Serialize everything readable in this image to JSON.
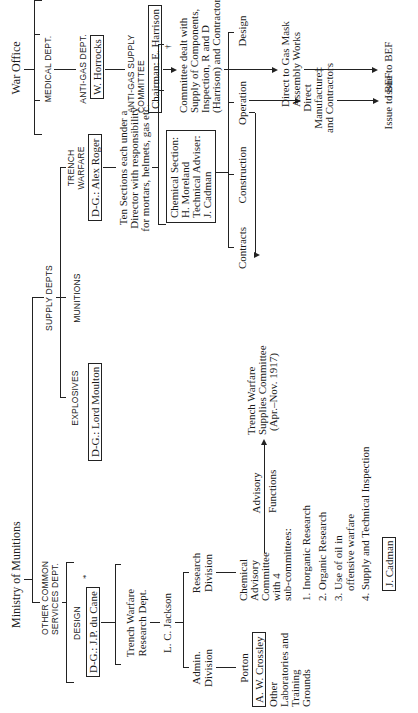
{
  "war_office": {
    "title": "War Office",
    "medical_dept": "MEDICAL DEPT.",
    "anti_gas_dept": "ANTI-GAS DEPT.",
    "anti_gas_head": "W. Horrocks",
    "anti_gas_supply_committee_l1": "ANTI-GAS SUPPLY",
    "anti_gas_supply_committee_l2": "COMMITTEE",
    "chairman": "Chairman: E. Harrison",
    "committee_desc": [
      "Committee dealt with",
      "Supply of Components,",
      "Inspection, R and D",
      "(Harrison) and Contractors"
    ],
    "gas_mask_works": [
      "Direct to Gas Mask",
      "Assembly Works"
    ],
    "issue_bef": "Issue to BEF"
  },
  "ministry": {
    "title": "Ministry of Munitions",
    "other_services_l1": "OTHER COMMON",
    "other_services_l2": "SERVICES DEPT.",
    "supply_depts": "SUPPLY DEPTS",
    "explosives": "EXPLOSIVES",
    "explosives_head": "D-G.: Lord Moulton",
    "munitions": "MUNITIONS",
    "trench_warfare_l1": "TRENCH",
    "trench_warfare_l2": "WARFARE",
    "trench_warfare_head": "D-G.: Alex Roger",
    "ten_sections": [
      "Ten Sections each under a",
      "Director with responsibility",
      "for mortars, helmets, gas etc."
    ],
    "dagger": "†",
    "chemical_section": [
      "Chemical Section:",
      "H. Moreland",
      "Technical Adviser:",
      "J. Cadman"
    ],
    "sub_units": [
      "Contracts",
      "Construction",
      "Operation",
      "Design"
    ],
    "direct_manufacture": [
      "Direct",
      "Manufacture‡",
      "and Contractors"
    ],
    "issue_bef": "Issue to BEF",
    "tw_supplies_committee": [
      "Trench Warfare",
      "Supplies Committee",
      "(Apr.–Nov. 1917)"
    ],
    "design": "DESIGN",
    "design_head": "D-G.: J.P. du Cane",
    "design_asterisk": "*",
    "tw_research_dept": [
      "Trench Warfare",
      "Research Dept."
    ],
    "lc_jackson": "L. C. Jackson",
    "admin_division": [
      "Admin.",
      "Division"
    ],
    "research_division": [
      "Research",
      "Division"
    ],
    "porton": "Porton",
    "porton_head": "A. W. Crossley",
    "other_labs": [
      "Other",
      "Laboratories and",
      "Training",
      "Grounds"
    ],
    "chemical_advisory": [
      "Chemical",
      "Advisory",
      "Committee",
      "with 4",
      "sub-committees:"
    ],
    "subcommittees": [
      "1. Inorganic Research",
      "2. Organic Research",
      "3. Use of oil in",
      "    offensive warfare",
      "4. Supply and Technical Inspection"
    ],
    "subcommittee_head": "J. Cadman",
    "advisory_l1": "Advisory",
    "advisory_l2": "Functions"
  }
}
